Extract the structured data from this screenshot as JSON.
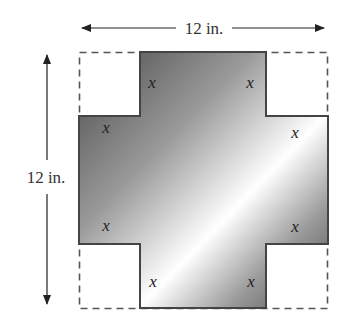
{
  "diagram": {
    "width_label": "12 in.",
    "height_label": "12 in.",
    "cut_labels": [
      "x",
      "x",
      "x",
      "x",
      "x",
      "x",
      "x",
      "x"
    ],
    "colors": {
      "dashed_outline": "#555555",
      "cross_outline": "#444444",
      "gradient_dark": "#4a4a4a",
      "gradient_light": "#ffffff"
    }
  }
}
